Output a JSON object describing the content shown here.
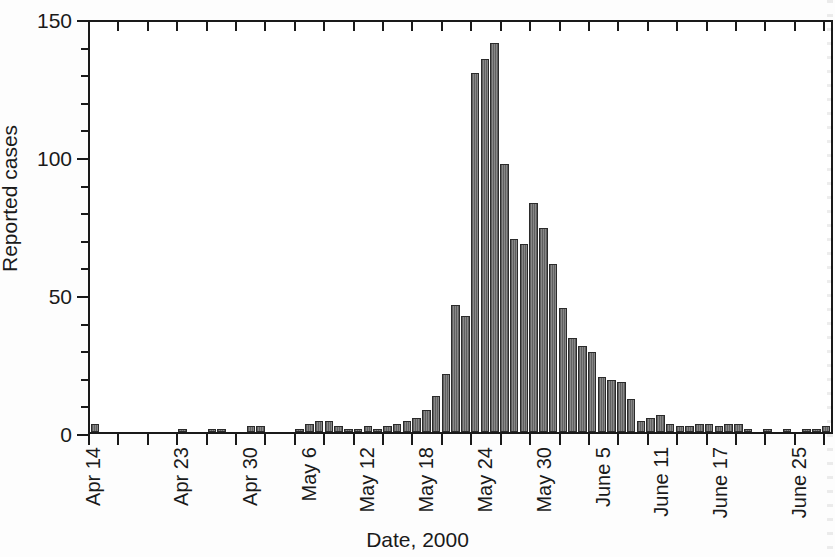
{
  "chart_data": {
    "type": "bar",
    "title": "",
    "xlabel": "Date, 2000",
    "ylabel": "Reported cases",
    "ylim": [
      0,
      150
    ],
    "y_major_ticks": [
      0,
      50,
      100,
      150
    ],
    "y_minor_tick_step": 10,
    "grid": false,
    "legend": null,
    "x_tick_labels": [
      "Apr 14",
      "Apr 23",
      "Apr 30",
      "May 6",
      "May 12",
      "May 18",
      "May 24",
      "May 30",
      "June 5",
      "June 11",
      "June 17",
      "June 25"
    ],
    "x_tick_label_indices": [
      0,
      9,
      16,
      22,
      28,
      34,
      40,
      46,
      52,
      58,
      64,
      72
    ],
    "categories": [
      "Apr 14",
      "Apr 15",
      "Apr 16",
      "Apr 17",
      "Apr 18",
      "Apr 19",
      "Apr 20",
      "Apr 21",
      "Apr 22",
      "Apr 23",
      "Apr 24",
      "Apr 25",
      "Apr 26",
      "Apr 27",
      "Apr 28",
      "Apr 29",
      "Apr 30",
      "May 1",
      "May 2",
      "May 3",
      "May 4",
      "May 5",
      "May 6",
      "May 7",
      "May 8",
      "May 9",
      "May 10",
      "May 11",
      "May 12",
      "May 13",
      "May 14",
      "May 15",
      "May 16",
      "May 17",
      "May 18",
      "May 19",
      "May 20",
      "May 21",
      "May 22",
      "May 23",
      "May 24",
      "May 25",
      "May 26",
      "May 27",
      "May 28",
      "May 29",
      "May 30",
      "May 31",
      "June 1",
      "June 2",
      "June 3",
      "June 4",
      "June 5",
      "June 6",
      "June 7",
      "June 8",
      "June 9",
      "June 10",
      "June 11",
      "June 12",
      "June 13",
      "June 14",
      "June 15",
      "June 16",
      "June 17",
      "June 18",
      "June 19",
      "June 20",
      "June 21",
      "June 22",
      "June 23",
      "June 24",
      "June 25",
      "June 26",
      "June 27",
      "June 28"
    ],
    "values": [
      3,
      0,
      0,
      0,
      0,
      0,
      0,
      0,
      0,
      1,
      0,
      0,
      1,
      1,
      0,
      0,
      2,
      2,
      0,
      0,
      0,
      1,
      3,
      4,
      4,
      2,
      1,
      1,
      2,
      1,
      2,
      3,
      4,
      5,
      8,
      13,
      21,
      46,
      42,
      130,
      135,
      141,
      97,
      70,
      68,
      83,
      74,
      61,
      45,
      34,
      31,
      29,
      20,
      19,
      18,
      12,
      4,
      5,
      6,
      3,
      2,
      2,
      3,
      3,
      2,
      3,
      3,
      1,
      0,
      1,
      0,
      1,
      0,
      1,
      1,
      2
    ]
  },
  "axes": {
    "y_title": "Reported cases",
    "x_title": "Date, 2000",
    "y_tick_0": "0",
    "y_tick_50": "50",
    "y_tick_100": "100",
    "y_tick_150": "150"
  }
}
